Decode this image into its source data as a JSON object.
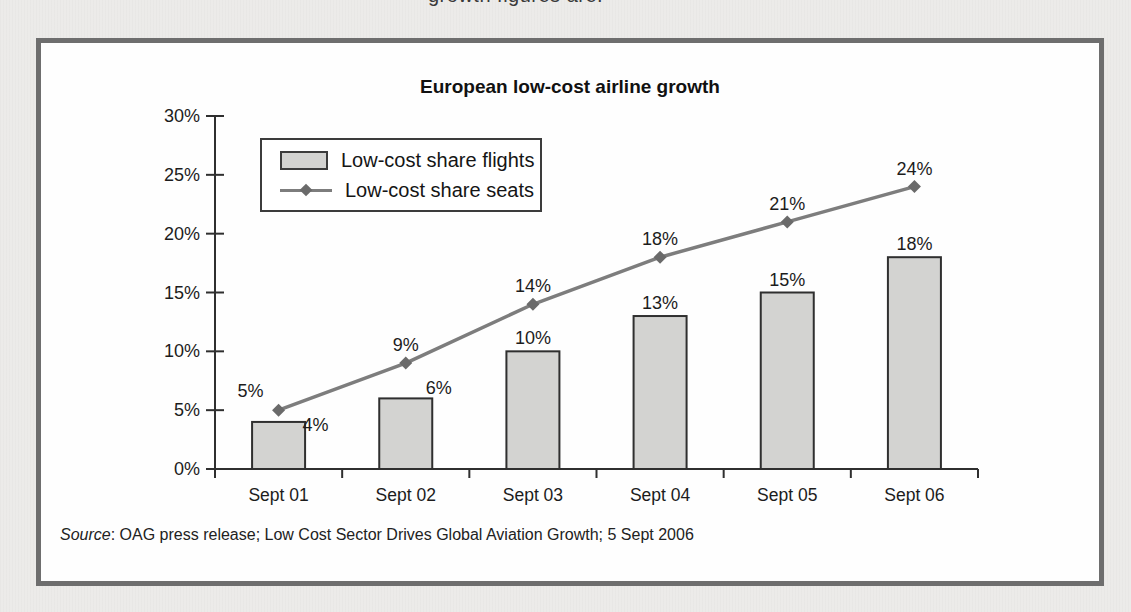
{
  "page": {
    "top_text_fragment": "growth figures are:",
    "background_color": "#ecebe9",
    "panel_border_color": "#6e6e6e",
    "panel_background": "#fefefe"
  },
  "chart_data": {
    "type": "bar",
    "title": "European low-cost airline growth",
    "categories": [
      "Sept 01",
      "Sept 02",
      "Sept 03",
      "Sept 04",
      "Sept 05",
      "Sept 06"
    ],
    "series": [
      {
        "name": "Low-cost share flights",
        "kind": "bar",
        "values": [
          4,
          6,
          10,
          13,
          15,
          18
        ],
        "labels": [
          "4%",
          "6%",
          "10%",
          "13%",
          "15%",
          "18%"
        ],
        "fill_color": "#d3d3d1",
        "border_color": "#2f2f2f"
      },
      {
        "name": "Low-cost share seats",
        "kind": "line",
        "values": [
          5,
          9,
          14,
          18,
          21,
          24
        ],
        "labels": [
          "5%",
          "9%",
          "14%",
          "18%",
          "21%",
          "24%"
        ],
        "line_color": "#7d7d7d",
        "marker": "diamond",
        "marker_color": "#6a6a6a"
      }
    ],
    "xlabel": "",
    "ylabel": "",
    "ylim": [
      0,
      30
    ],
    "ytick_step": 5,
    "ytick_labels": [
      "0%",
      "5%",
      "10%",
      "15%",
      "20%",
      "25%",
      "30%"
    ],
    "grid": false,
    "legend_position": "top-left",
    "axis_color": "#2f2f2f",
    "label_color": "#1c1c1c"
  },
  "source_note": {
    "prefix": "Source",
    "text": ": OAG press release; Low Cost Sector Drives Global Aviation Growth; 5 Sept 2006"
  }
}
